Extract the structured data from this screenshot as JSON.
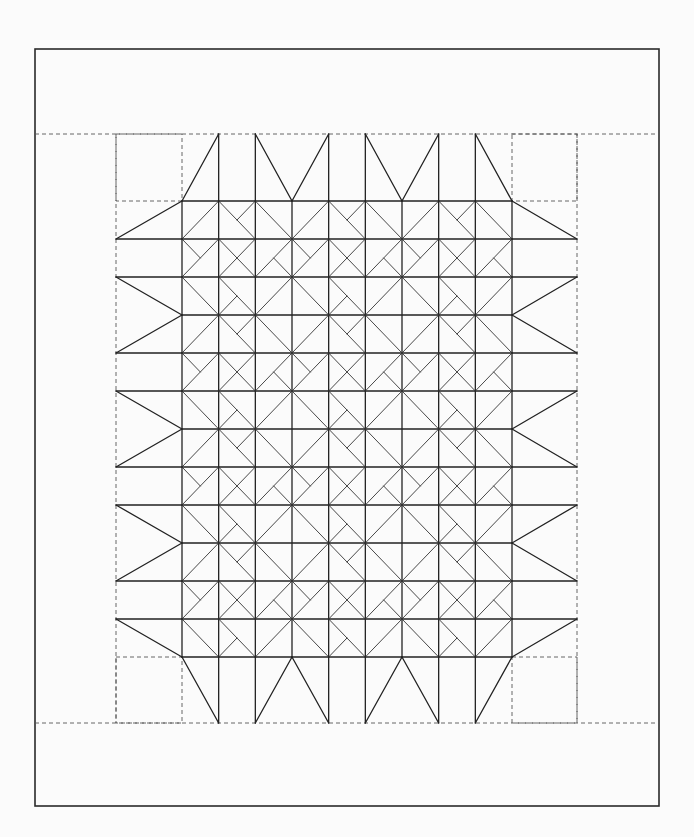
{
  "diagram": {
    "title": "",
    "colors": {
      "background": "#fbfbfb",
      "line": "#222222",
      "dashed": "#555555"
    },
    "frame": {
      "x1": 35,
      "y1": 49,
      "x2": 659,
      "y2": 806
    },
    "border_dashed": {
      "top_y": 134,
      "bottom_y": 723,
      "outer_left_x": 35,
      "outer_right_x": 659,
      "inner_left_x": 116,
      "inner_right_x": 577
    },
    "grid": {
      "x0": 182,
      "x1": 512,
      "cols": 9,
      "y0": 201,
      "y1": 657,
      "rows": 12
    },
    "corner_boxes": [
      {
        "name": "top-left",
        "x1": 116,
        "y1": 134,
        "x2": 182,
        "y2": 201
      },
      {
        "name": "top-right",
        "x1": 512,
        "y1": 134,
        "x2": 577,
        "y2": 201
      },
      {
        "name": "bottom-left",
        "x1": 116,
        "y1": 657,
        "x2": 182,
        "y2": 723
      },
      {
        "name": "bottom-right",
        "x1": 512,
        "y1": 657,
        "x2": 577,
        "y2": 723
      }
    ],
    "tile": {
      "size": [
        3,
        3
      ],
      "cells": [
        [
          [
            "/"
          ],
          [
            "\\",
            "half-/-tr"
          ],
          [
            "\\"
          ]
        ],
        [
          [
            "half-\\-tl",
            "/"
          ],
          [
            "\\",
            "/"
          ],
          [
            "/",
            "half-\\-br"
          ]
        ],
        [
          [
            "\\"
          ],
          [
            "\\",
            "half-/-bl"
          ],
          [
            "/"
          ]
        ]
      ]
    },
    "top_points": [
      {
        "type": "diag",
        "from": [
          0,
          "edge"
        ],
        "to": [
          1,
          "out"
        ]
      },
      {
        "type": "vert",
        "col": 1
      },
      {
        "type": "vert",
        "col": 2
      },
      {
        "type": "diag",
        "from": [
          2,
          "out"
        ],
        "to": [
          3,
          "edge"
        ]
      },
      {
        "type": "diag",
        "from": [
          3,
          "edge"
        ],
        "to": [
          4,
          "out"
        ]
      },
      {
        "type": "vert",
        "col": 4
      },
      {
        "type": "vert",
        "col": 5
      },
      {
        "type": "diag",
        "from": [
          5,
          "out"
        ],
        "to": [
          6,
          "edge"
        ]
      },
      {
        "type": "diag",
        "from": [
          6,
          "edge"
        ],
        "to": [
          7,
          "out"
        ]
      },
      {
        "type": "vert",
        "col": 7
      },
      {
        "type": "vert",
        "col": 8
      },
      {
        "type": "diag",
        "from": [
          8,
          "out"
        ],
        "to": [
          9,
          "edge"
        ]
      }
    ],
    "side_points": [
      {
        "type": "diag",
        "from": [
          0,
          "edge"
        ],
        "to": [
          1,
          "out"
        ]
      },
      {
        "type": "horz",
        "row": 1
      },
      {
        "type": "horz",
        "row": 2
      },
      {
        "type": "diag",
        "from": [
          2,
          "out"
        ],
        "to": [
          3,
          "edge"
        ]
      },
      {
        "type": "diag",
        "from": [
          3,
          "edge"
        ],
        "to": [
          4,
          "out"
        ]
      },
      {
        "type": "horz",
        "row": 4
      },
      {
        "type": "horz",
        "row": 5
      },
      {
        "type": "diag",
        "from": [
          5,
          "out"
        ],
        "to": [
          6,
          "edge"
        ]
      },
      {
        "type": "diag",
        "from": [
          6,
          "edge"
        ],
        "to": [
          7,
          "out"
        ]
      },
      {
        "type": "horz",
        "row": 7
      },
      {
        "type": "horz",
        "row": 8
      },
      {
        "type": "diag",
        "from": [
          8,
          "out"
        ],
        "to": [
          9,
          "edge"
        ]
      },
      {
        "type": "diag",
        "from": [
          9,
          "edge"
        ],
        "to": [
          10,
          "out"
        ]
      },
      {
        "type": "horz",
        "row": 10
      },
      {
        "type": "horz",
        "row": 11
      },
      {
        "type": "diag",
        "from": [
          11,
          "out"
        ],
        "to": [
          12,
          "edge"
        ]
      }
    ]
  }
}
